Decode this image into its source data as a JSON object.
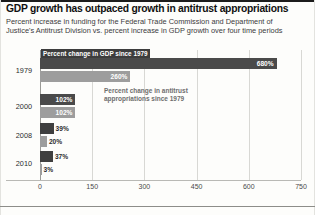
{
  "header": {
    "title": "GDP growth has outpaced growth in antitrust appropriations",
    "subtitle": "Percent increase in funding for the Federal Trade Commission and Department of Justice's Antitrust Division vs. percent increase in GDP growth over four time periods"
  },
  "legend": {
    "gdp_label": "Percent change in GDP since 1979",
    "antitrust_label": "Percent change in antitrust appropriations since 1979"
  },
  "colors": {
    "gdp_bar": "#4a4a4a",
    "antitrust_bar": "#9d9d9d",
    "gridline": "#d8d8d4",
    "legend_gdp_bg": "#3d3d3d",
    "legend_antitrust_text": "#6e6e6e"
  },
  "chart_data": {
    "type": "bar",
    "orientation": "horizontal",
    "title": "GDP growth has outpaced growth in antitrust appropriations",
    "subtitle": "Percent increase in funding for the Federal Trade Commission and Department of Justice's Antitrust Division vs. percent increase in GDP growth over four time periods",
    "xlabel": "",
    "ylabel": "",
    "categories": [
      "1979",
      "2000",
      "2008",
      "2010"
    ],
    "xlim": [
      0,
      750
    ],
    "xticks": [
      "0",
      "150",
      "300",
      "450",
      "600",
      "750"
    ],
    "xtick_values": [
      0,
      150,
      300,
      450,
      600,
      750
    ],
    "grid": true,
    "legend_position": "inline",
    "series": [
      {
        "name": "Percent change in GDP since 1979",
        "values": [
          680,
          102,
          39,
          37
        ],
        "labels": [
          "680%",
          "102%",
          "39%",
          "37%"
        ]
      },
      {
        "name": "Percent change in antitrust appropriations since 1979",
        "values": [
          260,
          102,
          20,
          3
        ],
        "labels": [
          "260%",
          "102%",
          "20%",
          "3%"
        ]
      }
    ]
  }
}
